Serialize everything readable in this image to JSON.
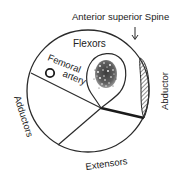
{
  "diagram": {
    "labels": {
      "landmark": "Anterior superior Spine",
      "flexors": "Flexors",
      "femoral_line1": "Femoral",
      "femoral_line2": "artery",
      "abductor": "Abductor",
      "adductors": "Adductors",
      "extensors": "Extensors"
    },
    "colors": {
      "stroke": "#2a2a2a",
      "hatch": "#555555",
      "text": "#222222",
      "background": "#ffffff"
    }
  }
}
